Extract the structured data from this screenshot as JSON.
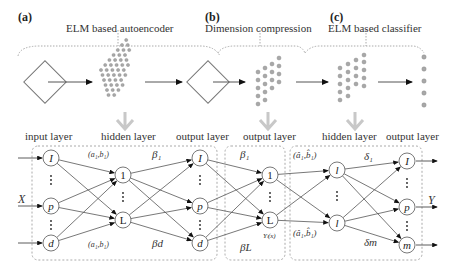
{
  "panels": [
    {
      "id": "a",
      "label": "(a)",
      "title": "ELM based autoencoder"
    },
    {
      "id": "b",
      "label": "(b)",
      "title": "Dimension compression"
    },
    {
      "id": "c",
      "label": "(c)",
      "title": "ELM based classifier"
    }
  ],
  "layer_labels": {
    "input_layer": "input layer",
    "hidden_layer_1": "hidden layer",
    "output_layer_1": "output layer",
    "output_layer_2": "output layer",
    "hidden_layer_2": "hidden layer",
    "output_layer_3": "output layer"
  },
  "nodes": {
    "input": [
      "I",
      "p",
      "d"
    ],
    "hidden1": [
      "1",
      "L"
    ],
    "output1": [
      "I",
      "p",
      "d"
    ],
    "compressed": [
      "1",
      "L"
    ],
    "hidden2": [
      "l",
      "l"
    ],
    "output2": [
      "I",
      "p",
      "m"
    ]
  },
  "edge_labels": {
    "a1b1_top": "(a₁,b₁)",
    "a1b1_bottom": "(a₁,b₁)",
    "beta1_a": "β₁",
    "betad": "βd",
    "beta1_b": "β₁",
    "betaL": "βL",
    "yl": "Yₗ(x)",
    "ahat_top": "(â₁,b̂₁)",
    "ahat_bottom": "(â₁,b̂₁)",
    "delta1": "δ₁",
    "deltam": "δm"
  },
  "io": {
    "input": "X",
    "output": "Y"
  },
  "colors": {
    "node_fill": "#a8a8a8",
    "node_stroke": "#808080",
    "arrow_gray": "#c8c8c8",
    "line": "#444444",
    "dashed": "#aaaaaa"
  }
}
